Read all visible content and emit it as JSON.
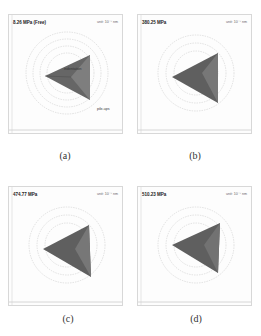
{
  "figure": {
    "panels": [
      {
        "id": "a",
        "caption": "(a)",
        "pressure_label": "8.26 MPa (Free)",
        "scale_label": "unit: 10⁻⁷ nm",
        "annotations": [
          "indentation",
          "pile-ups"
        ]
      },
      {
        "id": "b",
        "caption": "(b)",
        "pressure_label": "380.25 MPa",
        "scale_label": "unit: 10⁻⁷ nm",
        "annotations": []
      },
      {
        "id": "c",
        "caption": "(c)",
        "pressure_label": "474.77 MPa",
        "scale_label": "unit: 10⁻⁷ nm",
        "annotations": []
      },
      {
        "id": "d",
        "caption": "(d)",
        "pressure_label": "510.23 MPa",
        "scale_label": "unit: 10⁻⁷ nm",
        "annotations": []
      }
    ]
  },
  "colors": {
    "indent_dark": "#555555",
    "indent_mid": "#7a7a7a",
    "contour": "#bdbdbd",
    "frame": "#d8d8d8"
  }
}
